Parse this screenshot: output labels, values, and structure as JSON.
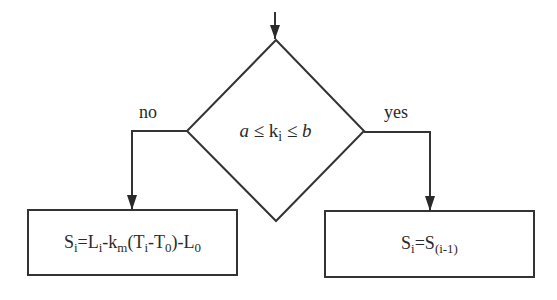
{
  "diagram": {
    "type": "flowchart-decision",
    "entry_arrow": {
      "direction": "down"
    },
    "decision": {
      "shape": "diamond",
      "condition": {
        "lower": "a",
        "op1": "≤",
        "variable": "k",
        "variable_sub": "i",
        "op2": "≤",
        "upper": "b"
      }
    },
    "branches": {
      "no": {
        "label": "no",
        "side": "left",
        "box": {
          "formula": {
            "lhs": "S",
            "lhs_sub": "i",
            "eq": "=",
            "t1": "L",
            "t1_sub": "i",
            "minus1": "-",
            "t2": "k",
            "t2_sub": "m",
            "paren_open": "(",
            "t3": "T",
            "t3_sub": "i",
            "minus2": "-",
            "t4": "T",
            "t4_sub": "0",
            "paren_close": ")",
            "minus3": "-",
            "t5": "L",
            "t5_sub": "0"
          }
        }
      },
      "yes": {
        "label": "yes",
        "side": "right",
        "box": {
          "formula": {
            "lhs": "S",
            "lhs_sub": "i",
            "eq": "=",
            "rhs": "S",
            "rhs_sub": "(i-1)"
          }
        }
      }
    },
    "colors": {
      "stroke": "#333333",
      "background": "#ffffff",
      "text": "#2a2a2a"
    }
  }
}
